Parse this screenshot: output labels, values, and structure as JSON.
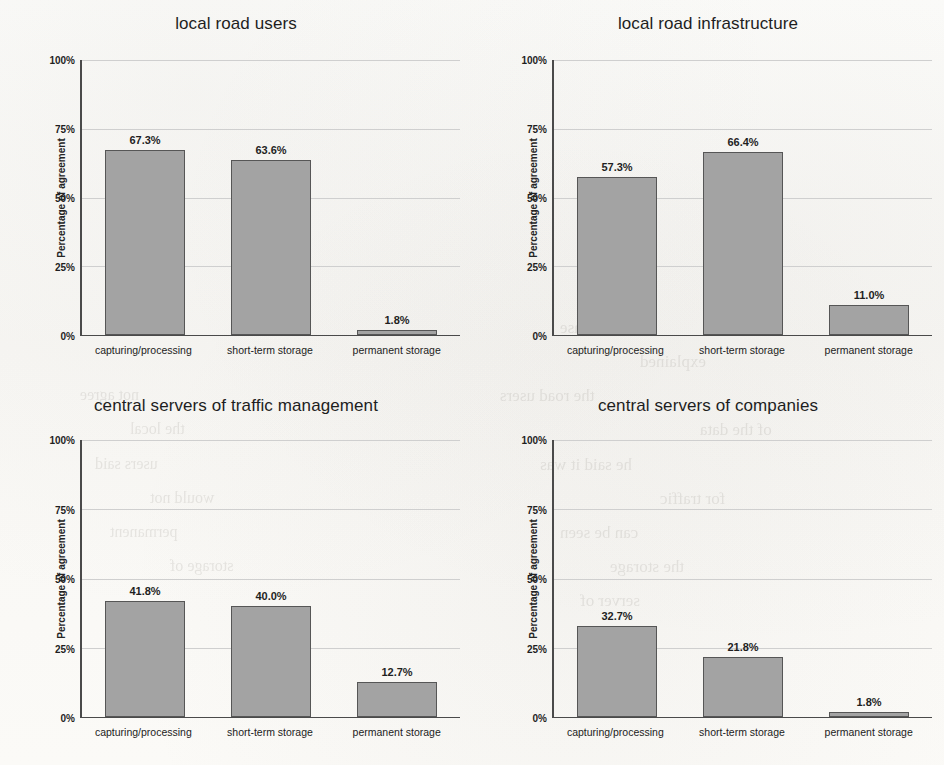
{
  "page": {
    "background_color": "#fbfbf9",
    "bar_fill_color": "#a3a3a3",
    "bar_border_color": "#565656",
    "axis_color": "#4a4a4a",
    "gridline_color": "#cfcfcf"
  },
  "axis": {
    "y_label": "Percentage of agreement",
    "y_ticks": [
      "100%",
      "75%",
      "50%",
      "25%",
      "0%"
    ],
    "categories": [
      "capturing/processing",
      "short-term storage",
      "permanent storage"
    ]
  },
  "ghost_text": [
    {
      "text": "in which case",
      "x": 560,
      "y": 318,
      "size": 17
    },
    {
      "text": "explained",
      "x": 640,
      "y": 352,
      "size": 17
    },
    {
      "text": "the road users",
      "x": 500,
      "y": 386,
      "size": 17
    },
    {
      "text": "of the data",
      "x": 700,
      "y": 420,
      "size": 17
    },
    {
      "text": "he said it was",
      "x": 540,
      "y": 455,
      "size": 17
    },
    {
      "text": "for traffic",
      "x": 660,
      "y": 489,
      "size": 17
    },
    {
      "text": "can be seen",
      "x": 560,
      "y": 523,
      "size": 17
    },
    {
      "text": "the storage",
      "x": 610,
      "y": 557,
      "size": 17
    },
    {
      "text": "server of",
      "x": 580,
      "y": 591,
      "size": 17
    },
    {
      "text": "not agree",
      "x": 80,
      "y": 386,
      "size": 16
    },
    {
      "text": "the local",
      "x": 130,
      "y": 420,
      "size": 16
    },
    {
      "text": "users said",
      "x": 95,
      "y": 455,
      "size": 16
    },
    {
      "text": "would not",
      "x": 150,
      "y": 489,
      "size": 16
    },
    {
      "text": "permanent",
      "x": 110,
      "y": 523,
      "size": 16
    },
    {
      "text": "storage of",
      "x": 170,
      "y": 557,
      "size": 16
    }
  ],
  "chart_data": [
    {
      "type": "bar",
      "title": "local road users",
      "xlabel": "",
      "ylabel": "Percentage of agreement",
      "categories": [
        "capturing/processing",
        "short-term storage",
        "permanent storage"
      ],
      "values": [
        67.3,
        63.6,
        1.8
      ],
      "labels": [
        "67.3%",
        "63.6%",
        "1.8%"
      ],
      "ylim": [
        0,
        100
      ],
      "yticks": [
        0,
        25,
        50,
        75,
        100
      ],
      "grid": true,
      "legend": "none"
    },
    {
      "type": "bar",
      "title": "local road infrastructure",
      "xlabel": "",
      "ylabel": "Percentage of agreement",
      "categories": [
        "capturing/processing",
        "short-term storage",
        "permanent storage"
      ],
      "values": [
        57.3,
        66.4,
        11.0
      ],
      "labels": [
        "57.3%",
        "66.4%",
        "11.0%"
      ],
      "ylim": [
        0,
        100
      ],
      "yticks": [
        0,
        25,
        50,
        75,
        100
      ],
      "grid": true,
      "legend": "none"
    },
    {
      "type": "bar",
      "title": "central servers of traffic management",
      "xlabel": "",
      "ylabel": "Percentage of agreement",
      "categories": [
        "capturing/processing",
        "short-term storage",
        "permanent storage"
      ],
      "values": [
        41.8,
        40.0,
        12.7
      ],
      "labels": [
        "41.8%",
        "40.0%",
        "12.7%"
      ],
      "ylim": [
        0,
        100
      ],
      "yticks": [
        0,
        25,
        50,
        75,
        100
      ],
      "grid": true,
      "legend": "none"
    },
    {
      "type": "bar",
      "title": "central servers of companies",
      "xlabel": "",
      "ylabel": "Percentage of agreement",
      "categories": [
        "capturing/processing",
        "short-term storage",
        "permanent storage"
      ],
      "values": [
        32.7,
        21.8,
        1.8
      ],
      "labels": [
        "32.7%",
        "21.8%",
        "1.8%"
      ],
      "ylim": [
        0,
        100
      ],
      "yticks": [
        0,
        25,
        50,
        75,
        100
      ],
      "grid": true,
      "legend": "none"
    }
  ]
}
